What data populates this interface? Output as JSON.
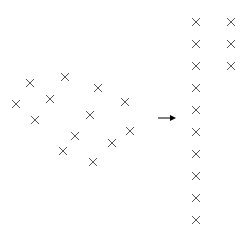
{
  "diagram": {
    "color": "#555555",
    "cross_size": 4,
    "scattered_points": [
      [
        30,
        83
      ],
      [
        65,
        77
      ],
      [
        98,
        88
      ],
      [
        16,
        104
      ],
      [
        50,
        99
      ],
      [
        125,
        102
      ],
      [
        35,
        120
      ],
      [
        90,
        115
      ],
      [
        75,
        136
      ],
      [
        130,
        131
      ],
      [
        112,
        143
      ],
      [
        63,
        151
      ],
      [
        93,
        162
      ]
    ],
    "arranged_points": [
      [
        196,
        22
      ],
      [
        196,
        44
      ],
      [
        196,
        66
      ],
      [
        196,
        88
      ],
      [
        196,
        110
      ],
      [
        196,
        132
      ],
      [
        196,
        154
      ],
      [
        196,
        176
      ],
      [
        196,
        198
      ],
      [
        196,
        220
      ],
      [
        231,
        22
      ],
      [
        231,
        44
      ],
      [
        231,
        66
      ]
    ],
    "arrow": {
      "x1": 158,
      "x2": 176,
      "y": 118
    }
  }
}
